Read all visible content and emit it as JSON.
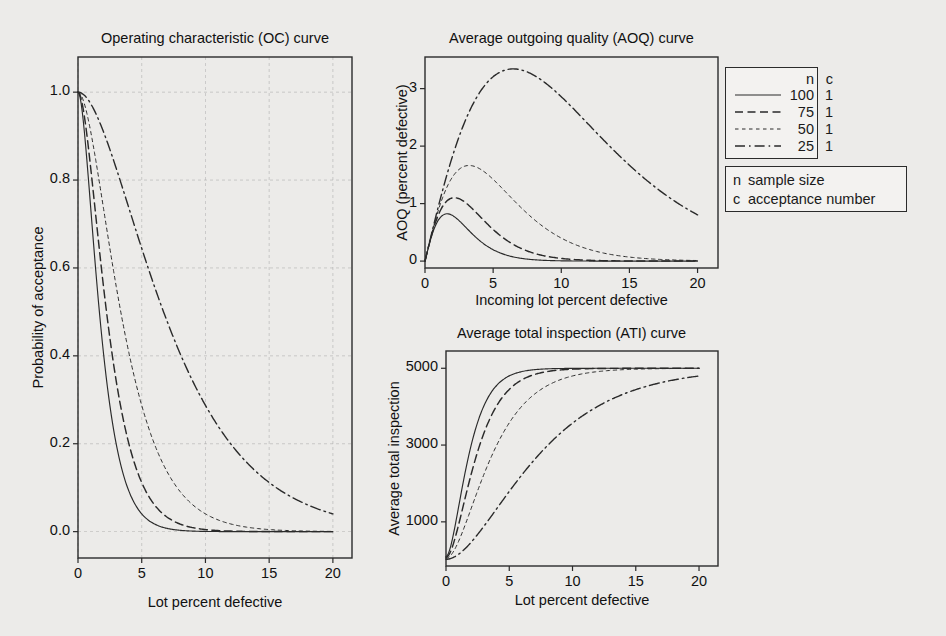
{
  "figure": {
    "background_color": "#ecebe9",
    "ink_color": "#2a2a2a"
  },
  "panels": {
    "oc": {
      "title": "Operating characteristic (OC) curve",
      "xlabel": "Lot percent defective",
      "ylabel": "Probability of acceptance",
      "xticks": [
        "0",
        "5",
        "10",
        "15",
        "20"
      ],
      "yticks": [
        "0.0",
        "0.2",
        "0.4",
        "0.6",
        "0.8",
        "1.0"
      ]
    },
    "aoq": {
      "title": "Average outgoing quality (AOQ) curve",
      "xlabel": "Incoming lot percent defective",
      "ylabel": "AOQ (percent defective)",
      "xticks": [
        "0",
        "5",
        "10",
        "15",
        "20"
      ],
      "yticks": [
        "0",
        "1",
        "2",
        "3"
      ]
    },
    "ati": {
      "title": "Average total inspection (ATI) curve",
      "xlabel": "Lot percent defective",
      "ylabel": "Average total inspection",
      "xticks": [
        "0",
        "5",
        "10",
        "15",
        "20"
      ],
      "yticks": [
        "1000",
        "3000",
        "5000"
      ]
    }
  },
  "legend": {
    "header_n": "n",
    "header_c": "c",
    "entries": [
      {
        "n": "100",
        "c": "1",
        "style": "solid"
      },
      {
        "n": "75",
        "c": "1",
        "style": "dashed"
      },
      {
        "n": "50",
        "c": "1",
        "style": "dotted"
      },
      {
        "n": "25",
        "c": "1",
        "style": "dashdot"
      }
    ]
  },
  "definitions": [
    {
      "key": "n",
      "value": "sample size"
    },
    {
      "key": "c",
      "value": "acceptance number"
    }
  ],
  "chart_data": [
    {
      "id": "oc",
      "type": "line",
      "title": "Operating characteristic (OC) curve",
      "xlabel": "Lot percent defective",
      "ylabel": "Probability of acceptance",
      "xlim": [
        0,
        21.5
      ],
      "ylim": [
        -0.06,
        1.08
      ],
      "xticks": [
        0,
        5,
        10,
        15,
        20
      ],
      "yticks": [
        0.0,
        0.2,
        0.4,
        0.6,
        0.8,
        1.0
      ],
      "grid": true,
      "legend_position": "outside-right",
      "x": [
        0,
        1,
        2,
        3,
        4,
        5,
        6,
        7,
        8,
        9,
        10,
        11,
        12,
        13,
        14,
        15,
        16,
        17,
        18,
        19,
        20
      ],
      "series": [
        {
          "name": "n=100 c=1",
          "style": "solid",
          "values": [
            1.0,
            0.7358,
            0.4033,
            0.1946,
            0.0872,
            0.0371,
            0.0152,
            0.006,
            0.0023,
            0.00087,
            0.00032,
            0.00011,
            4e-05,
            1.4e-05,
            5e-06,
            1.7e-06,
            6e-07,
            2e-07,
            6e-08,
            2e-08,
            7e-09
          ]
        },
        {
          "name": "n=75 c=1",
          "style": "dashed",
          "values": [
            1.0,
            0.8272,
            0.5572,
            0.3373,
            0.19,
            0.1016,
            0.0522,
            0.026,
            0.0126,
            0.006,
            0.0028,
            0.0013,
            0.0006,
            0.00025,
            0.00011,
            5e-05,
            2e-05,
            1e-05,
            4e-06,
            1.6e-06,
            7e-07
          ]
        },
        {
          "name": "n=50 c=1",
          "style": "dotted",
          "values": [
            1.0,
            0.9106,
            0.7358,
            0.5553,
            0.4005,
            0.2794,
            0.19,
            0.1265,
            0.0827,
            0.0532,
            0.0338,
            0.0212,
            0.0132,
            0.0081,
            0.0049,
            0.0029,
            0.0018,
            0.0011,
            0.0006,
            0.0004,
            0.0002
          ]
        },
        {
          "name": "n=25 c=1",
          "style": "dashdot",
          "values": [
            1.0,
            0.9742,
            0.9114,
            0.828,
            0.7358,
            0.6424,
            0.5527,
            0.4696,
            0.3947,
            0.3286,
            0.2712,
            0.222,
            0.1804,
            0.1456,
            0.1167,
            0.0931,
            0.0738,
            0.0582,
            0.0457,
            0.0357,
            0.0278
          ]
        }
      ]
    },
    {
      "id": "aoq",
      "type": "line",
      "title": "Average outgoing quality (AOQ) curve",
      "xlabel": "Incoming lot percent defective",
      "ylabel": "AOQ (percent defective)",
      "xlim": [
        0,
        21.5
      ],
      "ylim": [
        -0.12,
        3.55
      ],
      "xticks": [
        0,
        5,
        10,
        15,
        20
      ],
      "yticks": [
        0,
        1,
        2,
        3
      ],
      "grid": false,
      "legend_position": "outside-right",
      "x": [
        0,
        1,
        2,
        3,
        4,
        5,
        6,
        7,
        8,
        9,
        10,
        11,
        12,
        13,
        14,
        15,
        16,
        17,
        18,
        19,
        20
      ],
      "series": [
        {
          "name": "n=100 c=1",
          "style": "solid",
          "values": [
            0.0,
            0.7211,
            0.7905,
            0.5721,
            0.3417,
            0.1818,
            0.0894,
            0.0412,
            0.018,
            0.0077,
            0.0031,
            0.0012,
            0.0005,
            0.0002,
            7e-05,
            2e-05,
            1e-05,
            4e-06,
            1e-06,
            4e-07,
            1e-07
          ]
        },
        {
          "name": "n=75 c=1",
          "style": "dashed",
          "values": [
            0.0,
            0.8148,
            1.0979,
            0.9968,
            0.7486,
            0.5005,
            0.3086,
            0.1793,
            0.0993,
            0.0531,
            0.0276,
            0.0141,
            0.007,
            0.0034,
            0.0016,
            0.0008,
            0.0004,
            0.0002,
            0.0001,
            4e-05,
            2e-05
          ]
        },
        {
          "name": "n=50 c=1",
          "style": "dotted",
          "values": [
            0.0,
            0.9015,
            1.4568,
            1.6494,
            1.586,
            1.3835,
            1.1286,
            0.8768,
            0.6547,
            0.4739,
            0.3347,
            0.231,
            0.1567,
            0.1046,
            0.0688,
            0.0447,
            0.0287,
            0.0183,
            0.0116,
            0.0073,
            0.0046
          ]
        },
        {
          "name": "n=25 c=1",
          "style": "dashdot",
          "values": [
            0.0,
            0.9693,
            1.8138,
            2.4725,
            2.929,
            3.1964,
            3.3009,
            3.2697,
            3.1368,
            2.9435,
            2.6985,
            2.4297,
            2.1551,
            1.8847,
            1.6267,
            1.389,
            1.1752,
            0.9842,
            0.8185,
            0.675,
            0.5534
          ]
        }
      ]
    },
    {
      "id": "ati",
      "type": "line",
      "title": "Average total inspection (ATI) curve",
      "xlabel": "Lot percent defective",
      "ylabel": "Average total inspection",
      "xlim": [
        0,
        21.5
      ],
      "ylim": [
        -150,
        5450
      ],
      "xticks": [
        0,
        5,
        10,
        15,
        20
      ],
      "yticks": [
        1000,
        3000,
        5000
      ],
      "grid": false,
      "legend_position": "outside-right",
      "N": 5000,
      "x": [
        0,
        1,
        2,
        3,
        4,
        5,
        6,
        7,
        8,
        9,
        10,
        11,
        12,
        13,
        14,
        15,
        16,
        17,
        18,
        19,
        20
      ],
      "series": [
        {
          "name": "n=100 c=1",
          "style": "solid",
          "values": [
            100,
            1394,
            2924,
            3948,
            4473,
            4718,
            4855,
            4922,
            4989,
            4996,
            4998,
            4999,
            5000,
            5000,
            5000,
            5000,
            5000,
            5000,
            5000,
            5000,
            5000
          ]
        },
        {
          "name": "n=75 c=1",
          "style": "dashed",
          "values": [
            75,
            925,
            2257,
            3341,
            4020,
            4500,
            4743,
            4872,
            4938,
            4970,
            4986,
            4994,
            4997,
            4999,
            5000,
            5000,
            5000,
            5000,
            5000,
            5000,
            5000
          ]
        },
        {
          "name": "n=50 c=1",
          "style": "dotted",
          "values": [
            50,
            491,
            1356,
            2200,
            2930,
            3622,
            4060,
            4374,
            4591,
            4737,
            4833,
            4895,
            4935,
            4960,
            4976,
            4986,
            4991,
            4995,
            4997,
            4998,
            4999
          ]
        },
        {
          "name": "n=25 c=1",
          "style": "dashdot",
          "values": [
            25,
            153,
            464,
            877,
            1332,
            1794,
            2238,
            2649,
            3020,
            3347,
            3631,
            3875,
            4081,
            4253,
            4396,
            4513,
            4609,
            4686,
            4747,
            4797,
            4835
          ]
        }
      ]
    }
  ]
}
